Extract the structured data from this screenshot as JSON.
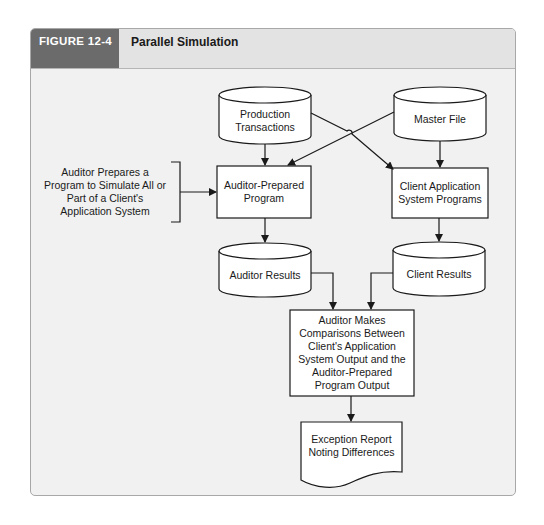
{
  "figure": {
    "number": "FIGURE 12-4",
    "title": "Parallel Simulation"
  },
  "nodes": {
    "production_transactions": "Production Transactions",
    "master_file": "Master File",
    "auditor_program": "Auditor-Prepared Program",
    "client_programs": "Client Application System Programs",
    "auditor_results": "Auditor Results",
    "client_results": "Client Results",
    "comparison": "Auditor Makes Comparisons Between Client's Application System Output and the Auditor-Prepared Program Output",
    "exception_report": "Exception Report Noting Differences"
  },
  "annotation": {
    "auditor_prepares": "Auditor Prepares a Program to Simulate All or Part of a Client's Application System"
  },
  "colors": {
    "header_tab": "#6b6b6b",
    "header_bar": "#e3e3e3",
    "panel_bg": "#f1f1f1",
    "stroke": "#1a1a1a",
    "node_fill": "#ffffff"
  }
}
